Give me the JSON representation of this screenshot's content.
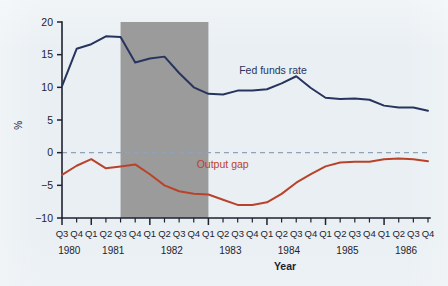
{
  "figure": {
    "background_color": "#e8eef2",
    "plot_background_color": "#e8eef2",
    "recession_band_color": "#9b9b9b",
    "zero_line_color": "#8fa3b8"
  },
  "chart_data": {
    "type": "line",
    "title": "",
    "xlabel": "Year",
    "ylabel": "%",
    "ylim": [
      -10,
      20
    ],
    "yticks": [
      20,
      15,
      10,
      5,
      0,
      -5,
      -10
    ],
    "ytick_labels": [
      "20",
      "15",
      "10",
      "5",
      "0",
      "−5",
      "−10"
    ],
    "grid": false,
    "legend_position": "inline-annotation",
    "x": [
      "Q3",
      "Q4",
      "Q1",
      "Q2",
      "Q3",
      "Q4",
      "Q1",
      "Q2",
      "Q3",
      "Q4",
      "Q1",
      "Q2",
      "Q3",
      "Q4",
      "Q1",
      "Q2",
      "Q3",
      "Q4",
      "Q1",
      "Q2",
      "Q3",
      "Q4",
      "Q1",
      "Q2",
      "Q3",
      "Q4"
    ],
    "x_year_groups": [
      {
        "year": "1980",
        "quarters": [
          "Q3",
          "Q4"
        ]
      },
      {
        "year": "1981",
        "quarters": [
          "Q1",
          "Q2",
          "Q3",
          "Q4"
        ]
      },
      {
        "year": "1982",
        "quarters": [
          "Q1",
          "Q2",
          "Q3",
          "Q4"
        ]
      },
      {
        "year": "1983",
        "quarters": [
          "Q1",
          "Q2",
          "Q3",
          "Q4"
        ]
      },
      {
        "year": "1984",
        "quarters": [
          "Q1",
          "Q2",
          "Q3",
          "Q4"
        ]
      },
      {
        "year": "1985",
        "quarters": [
          "Q1",
          "Q2",
          "Q3",
          "Q4"
        ]
      },
      {
        "year": "1986",
        "quarters": [
          "Q1",
          "Q2",
          "Q3",
          "Q4"
        ]
      }
    ],
    "series": [
      {
        "name": "Fed funds rate",
        "color": "#27345e",
        "label_position": {
          "x_index": 12.1,
          "y_value": 12.1
        },
        "values": [
          10.2,
          15.9,
          16.6,
          17.8,
          17.7,
          13.8,
          14.4,
          14.7,
          12.2,
          10.0,
          9.0,
          8.9,
          9.5,
          9.5,
          9.7,
          10.6,
          11.7,
          9.9,
          8.4,
          8.2,
          8.3,
          8.1,
          7.2,
          6.9,
          6.9,
          6.4
        ]
      },
      {
        "name": "Output gap",
        "color": "#b9432a",
        "label_position": {
          "x_index": 9.2,
          "y_value": -2.4
        },
        "values": [
          -3.4,
          -2.0,
          -1.0,
          -2.4,
          -2.1,
          -1.8,
          -3.3,
          -5.0,
          -5.9,
          -6.3,
          -6.4,
          -7.2,
          -8.0,
          -8.0,
          -7.6,
          -6.3,
          -4.6,
          -3.3,
          -2.1,
          -1.5,
          -1.4,
          -1.4,
          -1.0,
          -0.9,
          -1.0,
          -1.3
        ]
      }
    ],
    "shaded_regions": [
      {
        "name": "recession",
        "start_x_index": 4,
        "end_x_index": 10,
        "color": "#9b9b9b"
      }
    ]
  }
}
